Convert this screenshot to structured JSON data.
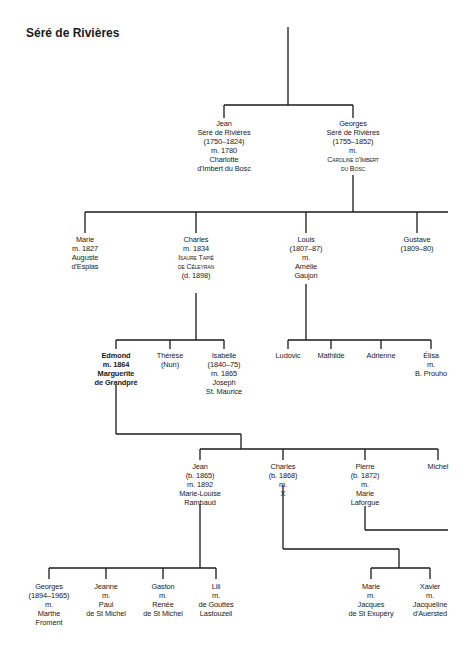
{
  "title": "Séré de Rivières",
  "line_color": "#1a1a1a",
  "generation1": {
    "jean": [
      "Jean",
      "Séré de Rivières",
      "(1750–1824)",
      "m. 1780",
      "Charlotte",
      "d'Imbert du Bosc"
    ],
    "georges": [
      "Georges",
      "Séré de Rivières",
      "(1755–1852)",
      "m.",
      "Caroline d'Imbert",
      "du Bosc"
    ]
  },
  "generation2": {
    "marie": [
      "Marie",
      "m. 1827",
      "Auguste",
      "d'Esplas"
    ],
    "charles": [
      "Charles",
      "m. 1834",
      "Isaure Tapié",
      "de Céleyran",
      "(d. 1898)"
    ],
    "louis": [
      "Louis",
      "(1807–87)",
      "m.",
      "Amélie",
      "Gaujon"
    ],
    "gustave": [
      "Gustave",
      "(1809–80)"
    ]
  },
  "generation3_charles": {
    "edmond": [
      "Edmond",
      "m. 1864",
      "Marguerite",
      "de Grandpré"
    ],
    "therese": [
      "Thérèse",
      "(Nun)"
    ],
    "isabelle": [
      "Isabelle",
      "(1840–75)",
      "m. 1865",
      "Joseph",
      "St. Maurice"
    ]
  },
  "generation3_louis": {
    "ludovic": [
      "Ludovic"
    ],
    "mathilde": [
      "Mathilde"
    ],
    "adrienne": [
      "Adrienne"
    ],
    "elisa": [
      "Élisa",
      "m.",
      "B. Prouho"
    ]
  },
  "generation4": {
    "jean": [
      "Jean",
      "(b. 1865)",
      "m. 1892",
      "Marie-Louise",
      "Rambaud"
    ],
    "charles": [
      "Charles",
      "(b. 1868)",
      "m.",
      "X"
    ],
    "pierre": [
      "Pierre",
      "(b. 1872)",
      "m.",
      "Marie",
      "Laforgue"
    ],
    "michel": [
      "Michel"
    ]
  },
  "generation5_jean": {
    "georges": [
      "Georges",
      "(1894–1965)",
      "m.",
      "Marthe",
      "Froment"
    ],
    "jeanne": [
      "Jeanne",
      "m.",
      "Paul",
      "de St Michel"
    ],
    "gaston": [
      "Gaston",
      "m.",
      "Renée",
      "de St Michel"
    ],
    "lili": [
      "Lili",
      "m.",
      "de Gouttes",
      "Lastouzeil"
    ]
  },
  "generation5_charles": {
    "marie": [
      "Marie",
      "m.",
      "Jacques",
      "de St Exupéry"
    ],
    "xavier": [
      "Xavier",
      "m.",
      "Jacqueline",
      "d'Auersted"
    ]
  }
}
